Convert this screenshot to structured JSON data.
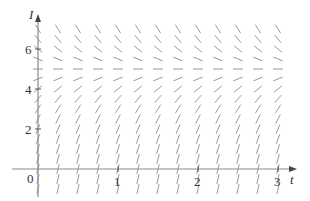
{
  "chart_data": {
    "type": "slope_field",
    "title": "",
    "equation": "dI/dt = k(5 - I)",
    "xlabel": "t",
    "ylabel": "I",
    "x_ticks": [
      {
        "value": 1,
        "label": "1"
      },
      {
        "value": 2,
        "label": "2"
      },
      {
        "value": 3,
        "label": "3"
      }
    ],
    "y_ticks": [
      {
        "value": 2,
        "label": "2"
      },
      {
        "value": 4,
        "label": "4"
      },
      {
        "value": 6,
        "label": "6"
      }
    ],
    "origin_label": "0",
    "xlim": [
      -0.33,
      3.25
    ],
    "ylim": [
      -1.35,
      7.7
    ],
    "grid": false,
    "t_samples": {
      "start": 0,
      "end": 3,
      "step": 0.25
    },
    "I_samples": {
      "start": -1,
      "end": 7,
      "step": 0.5
    },
    "equilibrium_I": 5,
    "k": 0.8,
    "segment_length_px": 10
  },
  "labels": {
    "y_axis": "I",
    "x_axis": "t",
    "origin": "0",
    "x1": "1",
    "x2": "2",
    "x3": "3",
    "y2": "2",
    "y4": "4",
    "y6": "6"
  },
  "colors": {
    "axis": "#8a8a8a",
    "segment": "#9a9a9a",
    "text": "#333333"
  }
}
